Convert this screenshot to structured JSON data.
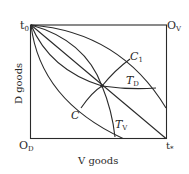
{
  "diagram": {
    "type": "edgeworth-box",
    "labels": {
      "t0": "t",
      "t0_sub": "0",
      "ov": "O",
      "ov_sub": "V",
      "od": "O",
      "od_sub": "D",
      "tstar": "t",
      "tstar_sub": "*",
      "c1": "C",
      "c1_sub": "1",
      "c": "C",
      "td": "T",
      "td_sub": "D",
      "tv": "T",
      "tv_sub": "V"
    },
    "axes": {
      "y_label": "D goods",
      "x_label": "V goods"
    },
    "colors": {
      "line": "#2a2a2a",
      "background": "#ffffff"
    }
  }
}
